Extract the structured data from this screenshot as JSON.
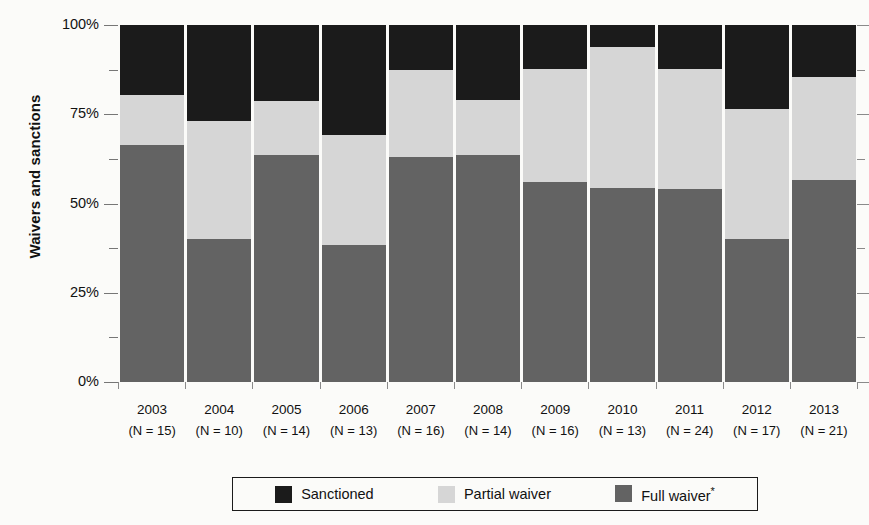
{
  "chart_data": {
    "type": "bar",
    "stacked": true,
    "stack_mode": "percent",
    "title": "",
    "xlabel": "",
    "ylabel": "Waivers and sanctions",
    "ylim": [
      0,
      100
    ],
    "ytick_labels": [
      "100%",
      "75%",
      "50%",
      "25%",
      "0%"
    ],
    "ytick_values": [
      100,
      75,
      50,
      25,
      0
    ],
    "yminor_values": [
      87.5,
      62.5,
      37.5,
      12.5
    ],
    "grid": false,
    "legend_position": "bottom",
    "categories": [
      "2003",
      "2004",
      "2005",
      "2006",
      "2007",
      "2008",
      "2009",
      "2010",
      "2011",
      "2012",
      "2013"
    ],
    "sample_sizes": [
      "(N = 15)",
      "(N = 10)",
      "(N = 14)",
      "(N = 13)",
      "(N = 16)",
      "(N = 14)",
      "(N = 16)",
      "(N = 13)",
      "(N = 24)",
      "(N = 17)",
      "(N = 21)"
    ],
    "series": [
      {
        "name": "Sanctioned",
        "color": "#1b1b1b",
        "values": [
          19.6,
          26.9,
          21.3,
          30.9,
          12.6,
          21.0,
          12.3,
          6.2,
          12.3,
          23.5,
          14.6
        ]
      },
      {
        "name": "Partial waiver",
        "color": "#d6d6d6",
        "values": [
          13.9,
          33.0,
          15.0,
          30.6,
          24.4,
          15.5,
          31.7,
          39.5,
          33.6,
          36.5,
          28.9
        ]
      },
      {
        "name": "Full waiver*",
        "color": "#636363",
        "values": [
          66.5,
          40.1,
          63.7,
          38.5,
          63.0,
          63.5,
          56.0,
          54.3,
          54.1,
          40.0,
          56.5
        ]
      }
    ]
  },
  "legend": {
    "items": [
      {
        "label": "Sanctioned",
        "superscript": "",
        "swatch_class": "sw-sanctioned",
        "name": "sanctioned"
      },
      {
        "label": "Partial waiver",
        "superscript": "",
        "swatch_class": "sw-partial",
        "name": "partial-waiver"
      },
      {
        "label": "Full waiver",
        "superscript": "*",
        "swatch_class": "sw-full",
        "name": "full-waiver"
      }
    ]
  },
  "colors": {
    "sanctioned": "#1b1b1b",
    "partial_waiver": "#d6d6d6",
    "full_waiver": "#636363",
    "background": "#fbfbf9",
    "axis": "#767676"
  }
}
